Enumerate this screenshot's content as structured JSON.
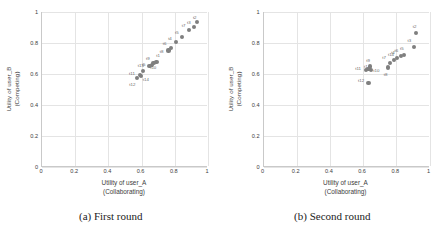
{
  "figure": {
    "panels": [
      {
        "id": "panel-a",
        "caption": "(a) First round",
        "chart_data": {
          "type": "scatter",
          "title": "",
          "xlabel": "Utility of user_A",
          "xlabel_line2": "(Collaborating)",
          "ylabel": "Utility of user_B",
          "ylabel_line2": "(Competing)",
          "xlim": [
            0,
            1
          ],
          "ylim": [
            0,
            1
          ],
          "xticks": [
            "0",
            "0.2",
            "0.4",
            "0.6",
            "0.8",
            "1"
          ],
          "yticks": [
            "0",
            "0.2",
            "0.4",
            "0.6",
            "0.8",
            "1"
          ],
          "xtick_values": [
            0,
            0.2,
            0.4,
            0.6,
            0.8,
            1
          ],
          "ytick_values": [
            0,
            0.2,
            0.4,
            0.6,
            0.8,
            1
          ],
          "grid": true,
          "legend": "none",
          "marker_color": "#7f7f7f",
          "points": [
            {
              "label": "t2",
              "x": 0.935,
              "y": 0.935,
              "lx": -0.015,
              "ly": 0.035
            },
            {
              "label": "t3",
              "x": 0.915,
              "y": 0.905,
              "lx": -0.03,
              "ly": 0.03
            },
            {
              "label": "t7",
              "x": 0.885,
              "y": 0.885,
              "lx": -0.032,
              "ly": 0.03
            },
            {
              "label": "t5",
              "x": 0.845,
              "y": 0.84,
              "lx": -0.032,
              "ly": 0.03
            },
            {
              "label": "t4",
              "x": 0.805,
              "y": 0.805,
              "lx": -0.034,
              "ly": 0.03
            },
            {
              "label": "t6",
              "x": 0.775,
              "y": 0.77,
              "lx": -0.036,
              "ly": 0.028
            },
            {
              "label": "t8",
              "x": 0.762,
              "y": 0.752,
              "lx": -0.042,
              "ly": -0.002
            },
            {
              "label": "t1",
              "x": 0.69,
              "y": 0.68,
              "lx": 0.01,
              "ly": 0.04
            },
            {
              "label": "t9",
              "x": 0.672,
              "y": 0.672,
              "lx": -0.034,
              "ly": 0.034
            },
            {
              "label": "t10",
              "x": 0.662,
              "y": 0.66,
              "lx": 0.008,
              "ly": -0.016
            },
            {
              "label": "t5b",
              "x": 0.648,
              "y": 0.65,
              "lx": -0.036,
              "ly": 0.016
            },
            {
              "label": "t13",
              "x": 0.608,
              "y": 0.618,
              "lx": -0.012,
              "ly": 0.038
            },
            {
              "label": "t11",
              "x": 0.588,
              "y": 0.592,
              "lx": -0.046,
              "ly": 0.016
            },
            {
              "label": "t14",
              "x": 0.596,
              "y": 0.585,
              "lx": 0.03,
              "ly": -0.018
            },
            {
              "label": "t12",
              "x": 0.572,
              "y": 0.572,
              "lx": -0.028,
              "ly": -0.036
            }
          ]
        }
      },
      {
        "id": "panel-b",
        "caption": "(b) Second round",
        "chart_data": {
          "type": "scatter",
          "title": "",
          "xlabel": "Utility of user_A",
          "xlabel_line2": "(Collaborating)",
          "ylabel": "Utility of user_B",
          "ylabel_line2": "(Competing)",
          "xlim": [
            0,
            1
          ],
          "ylim": [
            0,
            1
          ],
          "xticks": [
            "0",
            "0.2",
            "0.4",
            "0.6",
            "0.8",
            "1"
          ],
          "yticks": [
            "0",
            "0.2",
            "0.4",
            "0.6",
            "0.8",
            "1"
          ],
          "xtick_values": [
            0,
            0.2,
            0.4,
            0.6,
            0.8,
            1
          ],
          "ytick_values": [
            0,
            0.2,
            0.4,
            0.6,
            0.8,
            1
          ],
          "grid": true,
          "legend": "none",
          "marker_color": "#7f7f7f",
          "points": [
            {
              "label": "t2",
              "x": 0.92,
              "y": 0.865,
              "lx": -0.01,
              "ly": 0.046
            },
            {
              "label": "t3",
              "x": 0.905,
              "y": 0.775,
              "lx": -0.026,
              "ly": 0.044
            },
            {
              "label": "t5",
              "x": 0.845,
              "y": 0.725,
              "lx": -0.012,
              "ly": 0.04
            },
            {
              "label": "t6",
              "x": 0.828,
              "y": 0.718,
              "lx": -0.028,
              "ly": 0.036
            },
            {
              "label": "t4",
              "x": 0.806,
              "y": 0.705,
              "lx": -0.026,
              "ly": 0.038
            },
            {
              "label": "t14",
              "x": 0.786,
              "y": 0.692,
              "lx": -0.018,
              "ly": 0.04
            },
            {
              "label": "t7",
              "x": 0.76,
              "y": 0.672,
              "lx": -0.034,
              "ly": 0.038
            },
            {
              "label": "t8",
              "x": 0.748,
              "y": 0.642,
              "lx": -0.012,
              "ly": -0.04
            },
            {
              "label": "t9",
              "x": 0.64,
              "y": 0.648,
              "lx": -0.01,
              "ly": 0.042
            },
            {
              "label": "t10",
              "x": 0.648,
              "y": 0.628,
              "lx": 0.032,
              "ly": -0.004
            },
            {
              "label": "t1",
              "x": 0.632,
              "y": 0.632,
              "lx": -0.016,
              "ly": 0.02
            },
            {
              "label": "t11",
              "x": 0.618,
              "y": 0.626,
              "lx": -0.048,
              "ly": 0.01
            },
            {
              "label": "t12",
              "x": 0.632,
              "y": 0.54,
              "lx": -0.044,
              "ly": 0.024
            }
          ]
        }
      }
    ]
  }
}
